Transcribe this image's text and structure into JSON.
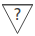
{
  "icon": {
    "name": "unknown-status-triangle",
    "glyph": "?",
    "stroke_color": "#4a4a4a",
    "fill_color": "#ffffff",
    "text_color": "#3a3a3a"
  }
}
